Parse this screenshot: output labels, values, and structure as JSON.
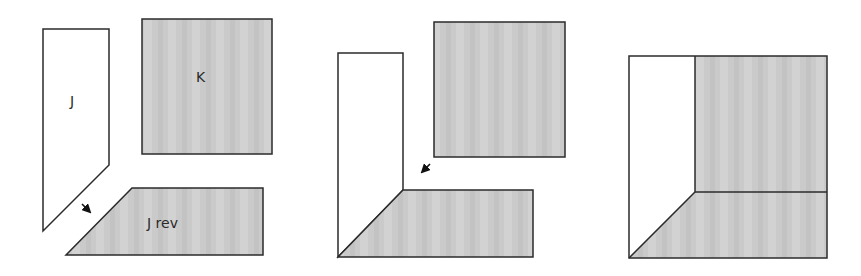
{
  "diagram": {
    "colors": {
      "outline": "#2b2b2b",
      "gray_fill": "#c9c9c9",
      "white_fill": "#ffffff"
    },
    "panels": [
      {
        "id": "step-1",
        "pieces": [
          {
            "name": "J",
            "label": "J",
            "fill": "white"
          },
          {
            "name": "K",
            "label": "K",
            "fill": "gray"
          },
          {
            "name": "J rev",
            "label": "J rev",
            "fill": "gray"
          }
        ],
        "arrow": {
          "direction": "down-right"
        }
      },
      {
        "id": "step-2",
        "pieces": [
          {
            "name": "J",
            "fill": "white"
          },
          {
            "name": "K",
            "fill": "gray"
          },
          {
            "name": "J rev",
            "fill": "gray"
          }
        ],
        "arrow": {
          "direction": "down-left"
        }
      },
      {
        "id": "step-3",
        "pieces": [
          {
            "name": "J",
            "fill": "white"
          },
          {
            "name": "K",
            "fill": "gray"
          },
          {
            "name": "J rev",
            "fill": "gray"
          }
        ]
      }
    ]
  }
}
